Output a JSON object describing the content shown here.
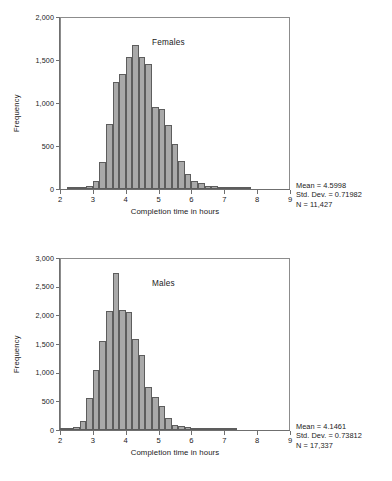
{
  "figure": {
    "axis_label_x": "Completion time in hours",
    "axis_label_y": "Frequency"
  },
  "chart_data": [
    {
      "type": "bar",
      "title": "Females",
      "xlabel": "Completion time in hours",
      "ylabel": "Frequency",
      "xlim": [
        2,
        9
      ],
      "ylim": [
        0,
        2000
      ],
      "xticks": [
        "2",
        "3",
        "4",
        "5",
        "6",
        "7",
        "8",
        "9"
      ],
      "xtick_values": [
        2,
        3,
        4,
        5,
        6,
        7,
        8,
        9
      ],
      "yticks": [
        "0",
        "500",
        "1,000",
        "1,500",
        "2,000"
      ],
      "ytick_values": [
        0,
        500,
        1000,
        1500,
        2000
      ],
      "grid": false,
      "bin_width": 0.2,
      "bin_starts": [
        2.2,
        2.4,
        2.6,
        2.8,
        3.0,
        3.2,
        3.4,
        3.6,
        3.8,
        4.0,
        4.2,
        4.4,
        4.6,
        4.8,
        5.0,
        5.2,
        5.4,
        5.6,
        5.8,
        6.0,
        6.2,
        6.4,
        6.6,
        6.8,
        7.0,
        7.2,
        7.4,
        7.6
      ],
      "values": [
        5,
        8,
        15,
        35,
        95,
        310,
        760,
        1245,
        1340,
        1530,
        1680,
        1530,
        1455,
        955,
        935,
        740,
        525,
        325,
        170,
        90,
        75,
        40,
        35,
        15,
        10,
        6,
        4,
        3
      ],
      "annotations": {
        "mean": "Mean = 4.5998",
        "std_dev": "Std. Dev. = 0.71982",
        "n": "N = 11,427"
      }
    },
    {
      "type": "bar",
      "title": "Males",
      "xlabel": "Completion time in hours",
      "ylabel": "Frequency",
      "xlim": [
        2,
        9
      ],
      "ylim": [
        0,
        3000
      ],
      "xticks": [
        "2",
        "3",
        "4",
        "5",
        "6",
        "7",
        "8",
        "9"
      ],
      "xtick_values": [
        2,
        3,
        4,
        5,
        6,
        7,
        8,
        9
      ],
      "yticks": [
        "0",
        "500",
        "1,000",
        "1,500",
        "2,000",
        "2,500",
        "3,000"
      ],
      "ytick_values": [
        0,
        500,
        1000,
        1500,
        2000,
        2500,
        3000
      ],
      "grid": false,
      "bin_width": 0.2,
      "bin_starts": [
        2.0,
        2.2,
        2.4,
        2.6,
        2.8,
        3.0,
        3.2,
        3.4,
        3.6,
        3.8,
        4.0,
        4.2,
        4.4,
        4.6,
        4.8,
        5.0,
        5.2,
        5.4,
        5.6,
        5.8,
        6.0,
        6.2,
        6.4,
        6.6,
        6.8,
        7.0,
        7.2
      ],
      "values": [
        20,
        35,
        60,
        155,
        560,
        1055,
        1560,
        2070,
        2740,
        2090,
        2060,
        1595,
        1310,
        755,
        570,
        415,
        210,
        95,
        70,
        45,
        18,
        12,
        8,
        5,
        4,
        3,
        2
      ],
      "annotations": {
        "mean": "Mean = 4.1461",
        "std_dev": "Std. Dev. = 0.73812",
        "n": "N = 17,337"
      }
    }
  ]
}
